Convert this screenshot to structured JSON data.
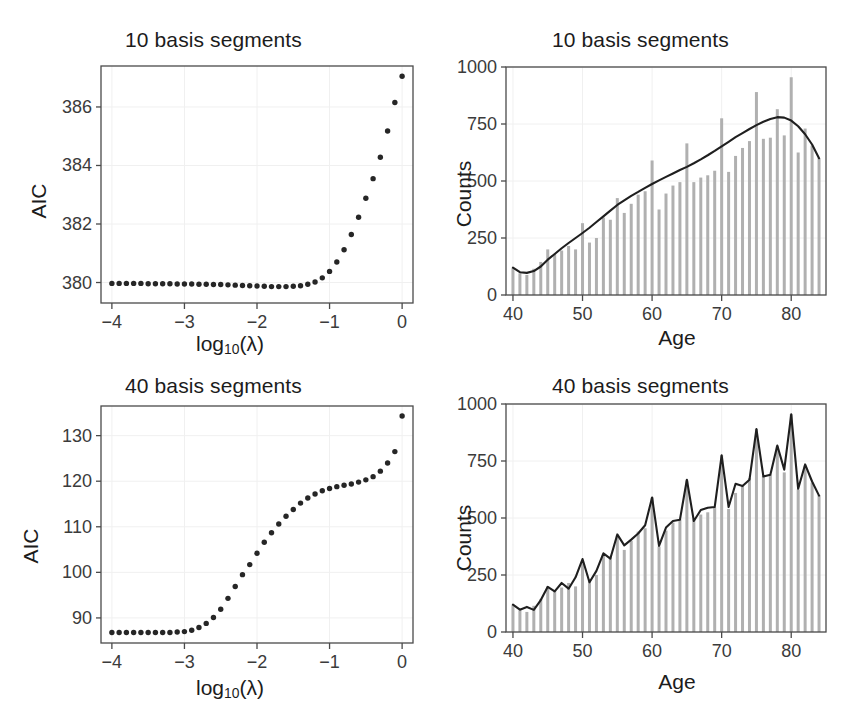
{
  "figure": {
    "width": 854,
    "height": 716,
    "background": "#ffffff",
    "point_color": "#262626",
    "line_color": "#1f1f1f",
    "bar_color": "#b0b0b0",
    "axis_color": "#4d4d4d",
    "grid_color": "#f0f0f0",
    "tick_label_color": "#3b3b3b"
  },
  "panels": {
    "top_left": {
      "title": "10 basis segments",
      "xlabel_main": "log",
      "xlabel_sub": "10",
      "xlabel_tail": "(λ)",
      "ylabel": "AIC"
    },
    "top_right": {
      "title": "10 basis segments",
      "xlabel": "Age",
      "ylabel": "Counts"
    },
    "bottom_left": {
      "title": "40 basis segments",
      "xlabel_main": "log",
      "xlabel_sub": "10",
      "xlabel_tail": "(λ)",
      "ylabel": "AIC"
    },
    "bottom_right": {
      "title": "40 basis segments",
      "xlabel": "Age",
      "ylabel": "Counts"
    }
  },
  "chart_data": [
    {
      "id": "aic-10-basis",
      "type": "scatter",
      "title": "10 basis segments",
      "xlabel": "log10(lambda)",
      "ylabel": "AIC",
      "xlim": [
        -4.15,
        0.15
      ],
      "ylim": [
        379.3,
        387.4
      ],
      "xticks": [
        -4,
        -3,
        -2,
        -1,
        0
      ],
      "xtick_labels": [
        "−4",
        "−3",
        "−2",
        "−1",
        "0"
      ],
      "yticks": [
        380,
        382,
        384,
        386
      ],
      "ytick_labels": [
        "380",
        "382",
        "384",
        "386"
      ],
      "grid": true,
      "x": [
        -4.0,
        -3.9,
        -3.8,
        -3.7,
        -3.6,
        -3.5,
        -3.4,
        -3.3,
        -3.2,
        -3.1,
        -3.0,
        -2.9,
        -2.8,
        -2.7,
        -2.6,
        -2.5,
        -2.4,
        -2.3,
        -2.2,
        -2.1,
        -2.0,
        -1.9,
        -1.8,
        -1.7,
        -1.6,
        -1.5,
        -1.4,
        -1.3,
        -1.2,
        -1.1,
        -1.0,
        -0.9,
        -0.8,
        -0.7,
        -0.6,
        -0.5,
        -0.4,
        -0.3,
        -0.2,
        -0.1,
        0.0
      ],
      "y": [
        379.97,
        379.97,
        379.97,
        379.97,
        379.97,
        379.96,
        379.96,
        379.96,
        379.96,
        379.95,
        379.95,
        379.95,
        379.94,
        379.94,
        379.93,
        379.93,
        379.92,
        379.91,
        379.9,
        379.89,
        379.88,
        379.87,
        379.86,
        379.86,
        379.86,
        379.87,
        379.89,
        379.94,
        380.02,
        380.16,
        380.38,
        380.7,
        381.12,
        381.64,
        382.23,
        382.88,
        383.55,
        384.28,
        385.18,
        386.15,
        387.05
      ]
    },
    {
      "id": "counts-10-basis",
      "type": "bar",
      "overlay": "line",
      "title": "10 basis segments",
      "xlabel": "Age",
      "ylabel": "Counts",
      "xlim": [
        39.0,
        85.0
      ],
      "ylim": [
        0,
        1000
      ],
      "xticks": [
        40,
        50,
        60,
        70,
        80
      ],
      "xtick_labels": [
        "40",
        "50",
        "60",
        "70",
        "80"
      ],
      "yticks": [
        0,
        250,
        500,
        750,
        1000
      ],
      "ytick_labels": [
        "0",
        "250",
        "500",
        "750",
        "1000"
      ],
      "grid": true,
      "categories": [
        40,
        41,
        42,
        43,
        44,
        45,
        46,
        47,
        48,
        49,
        50,
        51,
        52,
        53,
        54,
        55,
        56,
        57,
        58,
        59,
        60,
        61,
        62,
        63,
        64,
        65,
        66,
        67,
        68,
        69,
        70,
        71,
        72,
        73,
        74,
        75,
        76,
        77,
        78,
        79,
        80,
        81,
        82,
        83,
        84
      ],
      "values": [
        118,
        95,
        88,
        115,
        145,
        200,
        180,
        195,
        215,
        200,
        315,
        230,
        250,
        340,
        330,
        425,
        360,
        400,
        440,
        455,
        590,
        375,
        445,
        480,
        495,
        665,
        495,
        515,
        525,
        545,
        775,
        540,
        610,
        645,
        675,
        890,
        685,
        690,
        815,
        700,
        955,
        625,
        730,
        655,
        600
      ],
      "line_name": "P-spline fit",
      "line_x": [
        40,
        41,
        42,
        43,
        44,
        45,
        46,
        47,
        48,
        49,
        50,
        51,
        52,
        53,
        54,
        55,
        56,
        57,
        58,
        59,
        60,
        61,
        62,
        63,
        64,
        65,
        66,
        67,
        68,
        69,
        70,
        71,
        72,
        73,
        74,
        75,
        76,
        77,
        78,
        79,
        80,
        81,
        82,
        83,
        84
      ],
      "line_y": [
        120,
        100,
        97,
        105,
        125,
        155,
        180,
        205,
        228,
        250,
        272,
        295,
        320,
        345,
        370,
        395,
        415,
        435,
        452,
        470,
        487,
        503,
        518,
        533,
        548,
        562,
        578,
        595,
        613,
        632,
        652,
        672,
        692,
        710,
        728,
        745,
        760,
        772,
        780,
        778,
        765,
        740,
        705,
        660,
        600
      ]
    },
    {
      "id": "aic-40-basis",
      "type": "scatter",
      "title": "40 basis segments",
      "xlabel": "log10(lambda)",
      "ylabel": "AIC",
      "xlim": [
        -4.15,
        0.15
      ],
      "ylim": [
        84.5,
        136.5
      ],
      "xticks": [
        -4,
        -3,
        -2,
        -1,
        0
      ],
      "xtick_labels": [
        "−4",
        "−3",
        "−2",
        "−1",
        "0"
      ],
      "yticks": [
        90,
        100,
        110,
        120,
        130
      ],
      "ytick_labels": [
        "90",
        "100",
        "110",
        "120",
        "130"
      ],
      "grid": true,
      "x": [
        -4.0,
        -3.9,
        -3.8,
        -3.7,
        -3.6,
        -3.5,
        -3.4,
        -3.3,
        -3.2,
        -3.1,
        -3.0,
        -2.9,
        -2.8,
        -2.7,
        -2.6,
        -2.5,
        -2.4,
        -2.3,
        -2.2,
        -2.1,
        -2.0,
        -1.9,
        -1.8,
        -1.7,
        -1.6,
        -1.5,
        -1.4,
        -1.3,
        -1.2,
        -1.1,
        -1.0,
        -0.9,
        -0.8,
        -0.7,
        -0.6,
        -0.5,
        -0.4,
        -0.3,
        -0.2,
        -0.1,
        0.0
      ],
      "y": [
        86.8,
        86.8,
        86.8,
        86.8,
        86.8,
        86.8,
        86.8,
        86.8,
        86.8,
        86.9,
        87.0,
        87.3,
        87.9,
        88.8,
        90.1,
        91.9,
        94.3,
        96.9,
        99.5,
        101.7,
        104.2,
        106.6,
        108.7,
        110.6,
        112.3,
        113.8,
        115.2,
        116.3,
        117.2,
        117.9,
        118.4,
        118.8,
        119.1,
        119.4,
        119.8,
        120.3,
        121.0,
        122.2,
        124.0,
        126.5,
        134.3
      ]
    },
    {
      "id": "counts-40-basis",
      "type": "bar",
      "overlay": "line",
      "title": "40 basis segments",
      "xlabel": "Age",
      "ylabel": "Counts",
      "xlim": [
        39.0,
        85.0
      ],
      "ylim": [
        0,
        1000
      ],
      "xticks": [
        40,
        50,
        60,
        70,
        80
      ],
      "xtick_labels": [
        "40",
        "50",
        "60",
        "70",
        "80"
      ],
      "yticks": [
        0,
        250,
        500,
        750,
        1000
      ],
      "ytick_labels": [
        "0",
        "250",
        "500",
        "750",
        "1000"
      ],
      "grid": true,
      "categories": [
        40,
        41,
        42,
        43,
        44,
        45,
        46,
        47,
        48,
        49,
        50,
        51,
        52,
        53,
        54,
        55,
        56,
        57,
        58,
        59,
        60,
        61,
        62,
        63,
        64,
        65,
        66,
        67,
        68,
        69,
        70,
        71,
        72,
        73,
        74,
        75,
        76,
        77,
        78,
        79,
        80,
        81,
        82,
        83,
        84
      ],
      "values": [
        118,
        95,
        88,
        115,
        145,
        200,
        180,
        195,
        215,
        200,
        315,
        230,
        250,
        340,
        330,
        425,
        360,
        400,
        440,
        455,
        590,
        375,
        445,
        480,
        495,
        665,
        495,
        515,
        525,
        545,
        775,
        540,
        610,
        645,
        675,
        890,
        685,
        690,
        815,
        700,
        955,
        625,
        730,
        655,
        600
      ],
      "line_name": "P-spline fit",
      "line_x": [
        40,
        41,
        42,
        43,
        44,
        45,
        46,
        47,
        48,
        49,
        50,
        51,
        52,
        53,
        54,
        55,
        56,
        57,
        58,
        59,
        60,
        61,
        62,
        63,
        64,
        65,
        66,
        67,
        68,
        69,
        70,
        71,
        72,
        73,
        74,
        75,
        76,
        77,
        78,
        79,
        80,
        81,
        82,
        83,
        84
      ],
      "line_y": [
        120,
        98,
        110,
        97,
        140,
        198,
        178,
        215,
        190,
        240,
        320,
        218,
        268,
        345,
        322,
        428,
        380,
        405,
        432,
        468,
        590,
        378,
        458,
        487,
        492,
        668,
        487,
        535,
        545,
        548,
        775,
        548,
        650,
        640,
        668,
        890,
        682,
        690,
        818,
        712,
        955,
        628,
        735,
        660,
        598
      ]
    }
  ]
}
